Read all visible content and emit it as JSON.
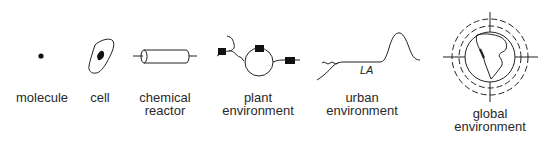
{
  "diagram": {
    "items": [
      {
        "id": "molecule",
        "label": [
          "molecule"
        ],
        "icon": "dot-icon"
      },
      {
        "id": "cell",
        "label": [
          "cell"
        ],
        "icon": "cell-icon"
      },
      {
        "id": "chemical-reactor",
        "label": [
          "chemical",
          "reactor"
        ],
        "icon": "cylinder-reactor-icon"
      },
      {
        "id": "plant-environment",
        "label": [
          "plant",
          "environment"
        ],
        "icon": "plant-network-icon"
      },
      {
        "id": "urban-environment",
        "label": [
          "urban",
          "environment"
        ],
        "icon": "terrain-profile-icon",
        "annotation": "LA"
      },
      {
        "id": "global-environment",
        "label": [
          "global",
          "environment"
        ],
        "icon": "globe-icon"
      }
    ]
  }
}
